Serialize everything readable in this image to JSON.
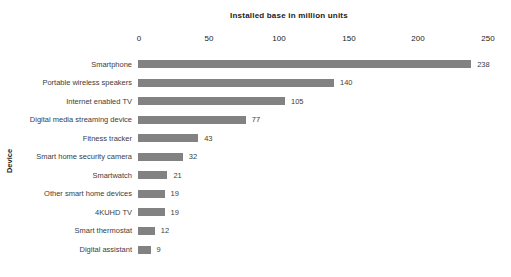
{
  "chart_data": {
    "type": "bar",
    "orientation": "horizontal",
    "xlabel": "Installed base in million units",
    "ylabel": "Device",
    "xlim": [
      0,
      250
    ],
    "xticks": [
      "0",
      "50",
      "100",
      "150",
      "200",
      "250"
    ],
    "categories": [
      "Smartphone",
      "Portable wireless speakers",
      "Internet enabled TV",
      "Digital media streaming device",
      "Fitness tracker",
      "Smart home security camera",
      "Smartwatch",
      "Other smart home devices",
      "4KUHD TV",
      "Smart thermostat",
      "Digital assistant"
    ],
    "values": [
      238,
      140,
      105,
      77,
      43,
      32,
      21,
      19,
      19,
      12,
      9
    ],
    "value_labels": [
      "238",
      "140",
      "105",
      "77",
      "43",
      "32",
      "21",
      "19",
      "19",
      "12",
      "9"
    ],
    "bar_color": "#828282",
    "text_color": "#3d3d3d",
    "grid": "off",
    "legend": "none"
  }
}
